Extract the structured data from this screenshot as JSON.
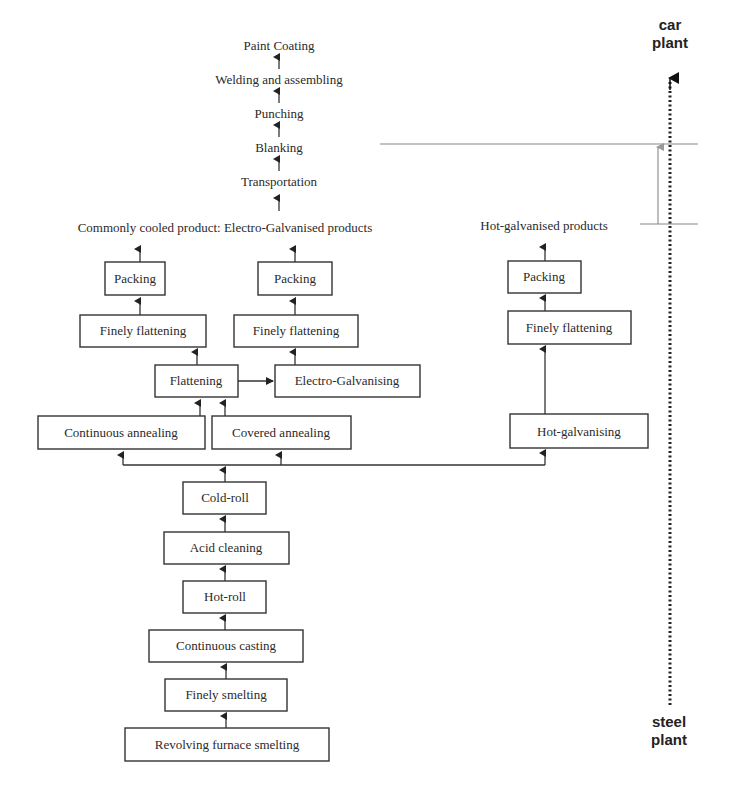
{
  "diagram": {
    "car_side": {
      "steps_top_down": [
        "Paint Coating",
        "Welding and assembling",
        "Punching",
        "Blanking",
        "Transportation"
      ]
    },
    "products": {
      "cold_electro": "Commonly cooled product: Electro-Galvanised products",
      "hot_galvanised": "Hot-galvanised products"
    },
    "branches": {
      "left": {
        "packing": "Packing",
        "finely_flattening": "Finely flattening"
      },
      "middle": {
        "packing": "Packing",
        "finely_flattening": "Finely flattening"
      },
      "right": {
        "packing": "Packing",
        "finely_flattening": "Finely flattening"
      }
    },
    "middle_row": {
      "flattening": "Flattening",
      "electro_galvanising": "Electro-Galvanising"
    },
    "annealing_row": {
      "continuous_annealing": "Continuous annealing",
      "covered_annealing": "Covered annealing",
      "hot_galvanising": "Hot-galvanising"
    },
    "trunk": [
      "Cold-roll",
      "Acid cleaning",
      "Hot-roll",
      "Continuous casting",
      "Finely smelting",
      "Revolving furnace smelting"
    ],
    "axis": {
      "top_label_line1": "car",
      "top_label_line2": "plant",
      "bottom_label_line1": "steel",
      "bottom_label_line2": "plant"
    }
  }
}
